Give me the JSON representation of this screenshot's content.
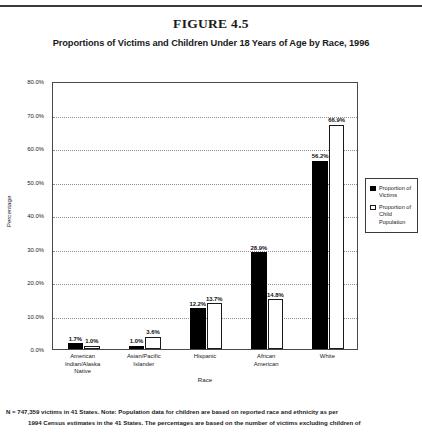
{
  "figure": {
    "number_label": "FIGURE 4.5",
    "subtitle": "Proportions of Victims and Children Under 18 Years of Age by Race, 1996"
  },
  "footnote": {
    "line1": "N = 747,359 victims in 41 States. Note: Population data for children are based on reported race and ethnicity as per",
    "line2": "1994 Census estimates in the 41 States. The percentages are based on the number of victims excluding children of"
  },
  "legend": {
    "items": [
      {
        "label": "Proportion of Victims",
        "style": "filled",
        "color": "#000000"
      },
      {
        "label": "Proportion of Child Population",
        "style": "open",
        "color": "#ffffff"
      }
    ]
  },
  "chart_data": {
    "type": "bar",
    "title": "Proportions of Victims and Children Under 18 Years of Age by Race, 1996",
    "xlabel": "Race",
    "ylabel": "Percentage",
    "ylim": [
      0,
      80
    ],
    "yticks": [
      "0.0%",
      "10.0%",
      "20.0%",
      "30.0%",
      "40.0%",
      "50.0%",
      "60.0%",
      "70.0%",
      "80.0%"
    ],
    "ytick_values": [
      0,
      10,
      20,
      30,
      40,
      50,
      60,
      70,
      80
    ],
    "grid": true,
    "legend_position": "right",
    "categories": [
      "American\nIndian/Alaska\nNative",
      "Asian/Pacific\nIslander",
      "Hispanic",
      "African\nAmerican",
      "White"
    ],
    "series": [
      {
        "name": "Proportion of Victims",
        "values": [
          1.7,
          1.0,
          12.2,
          28.9,
          56.2
        ],
        "labels": [
          "1.7%",
          "1.0%",
          "12.2%",
          "28.9%",
          "56.2%"
        ]
      },
      {
        "name": "Proportion of Child Population",
        "values": [
          1.0,
          3.6,
          13.7,
          14.8,
          66.9
        ],
        "labels": [
          "1.0%",
          "3.6%",
          "13.7%",
          "14.8%",
          "66.9%"
        ]
      }
    ]
  }
}
